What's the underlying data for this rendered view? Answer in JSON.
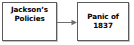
{
  "diagram": {
    "type": "flowchart",
    "title": "",
    "orientation": "left-to-right",
    "background_color": "#ffffff",
    "border_color": "#5b5b5b",
    "text_color": "#000000",
    "nodes": [
      {
        "id": "policies",
        "name": "jackson-policies-node",
        "lines": [
          "Jackson’s",
          "Policies"
        ],
        "line1": "Jackson’s",
        "line2": "Policies",
        "vertical_align": "top"
      },
      {
        "id": "panic",
        "name": "panic-1837-node",
        "lines": [
          "Panic of",
          "1837"
        ],
        "line1": "Panic of",
        "line2": "1837",
        "vertical_align": "middle"
      }
    ],
    "connectors": [
      {
        "id": "arrow-1",
        "name": "arrow-policies-to-panic",
        "from": "policies",
        "to": "panic",
        "style": "solid-arrow",
        "direction": "right",
        "color": "#6e6e6e",
        "label": ""
      }
    ]
  }
}
